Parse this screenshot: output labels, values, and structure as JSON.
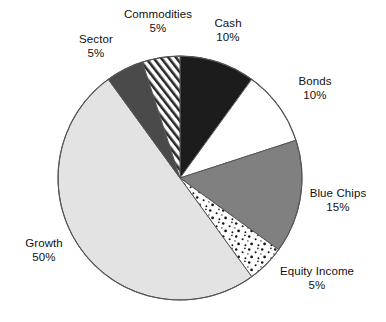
{
  "chart_data": {
    "type": "pie",
    "title": "",
    "subtitle": "",
    "xlabel": "",
    "ylabel": "",
    "legend_position": "none",
    "labels_position": "outside-callout",
    "grid": false,
    "total": 100,
    "units": "%",
    "start_angle_deg": 0,
    "direction": "clockwise",
    "categories": [
      "Cash",
      "Bonds",
      "Blue Chips",
      "Equity Income",
      "Growth",
      "Sector",
      "Commodities"
    ],
    "values": [
      10,
      10,
      15,
      5,
      50,
      5,
      5
    ],
    "slices": [
      {
        "name": "Cash",
        "value": 10,
        "label": "Cash",
        "value_label": "10%",
        "fill": "#1c1c1c",
        "pattern": "solid",
        "start_deg": 0,
        "end_deg": 36
      },
      {
        "name": "Bonds",
        "value": 10,
        "label": "Bonds",
        "value_label": "10%",
        "fill": "#ffffff",
        "pattern": "solid",
        "start_deg": 36,
        "end_deg": 72
      },
      {
        "name": "Blue Chips",
        "value": 15,
        "label": "Blue Chips",
        "value_label": "15%",
        "fill": "#808080",
        "pattern": "solid",
        "start_deg": 72,
        "end_deg": 126
      },
      {
        "name": "Equity Income",
        "value": 5,
        "label": "Equity Income",
        "value_label": "5%",
        "fill": "#ffffff",
        "pattern": "speckled-dots",
        "start_deg": 126,
        "end_deg": 144
      },
      {
        "name": "Growth",
        "value": 50,
        "label": "Growth",
        "value_label": "50%",
        "fill": "#e3e3e3",
        "pattern": "solid",
        "start_deg": 144,
        "end_deg": 324
      },
      {
        "name": "Sector",
        "value": 5,
        "label": "Sector",
        "value_label": "5%",
        "fill": "#4a4a4a",
        "pattern": "solid",
        "start_deg": 324,
        "end_deg": 342
      },
      {
        "name": "Commodities",
        "value": 5,
        "label": "Commodities",
        "value_label": "5%",
        "fill": "#ffffff",
        "pattern": "diagonal-hatch",
        "start_deg": 342,
        "end_deg": 360
      }
    ],
    "colors": {
      "cash": "#1c1c1c",
      "bonds": "#ffffff",
      "blue_chips": "#808080",
      "equity_income": "#ffffff",
      "growth": "#e3e3e3",
      "sector": "#4a4a4a",
      "commodities": "#ffffff",
      "outline": "#555555",
      "text": "#111111",
      "background": "#ffffff"
    },
    "geometry": {
      "center_x": 180,
      "center_y": 178,
      "radius": 122
    }
  },
  "labels": {
    "commodities": {
      "name": "Commodities",
      "value": "5%"
    },
    "cash": {
      "name": "Cash",
      "value": "10%"
    },
    "sector": {
      "name": "Sector",
      "value": "5%"
    },
    "bonds": {
      "name": "Bonds",
      "value": "10%"
    },
    "blue_chips": {
      "name": "Blue Chips",
      "value": "15%"
    },
    "equity_income": {
      "name": "Equity Income",
      "value": "5%"
    },
    "growth": {
      "name": "Growth",
      "value": "50%"
    }
  }
}
